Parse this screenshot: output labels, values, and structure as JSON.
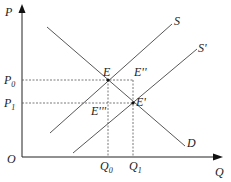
{
  "diagram": {
    "type": "supply-demand",
    "axes": {
      "y_label": "P",
      "x_label": "Q",
      "origin_label": "O"
    },
    "price_ticks": [
      {
        "label": "P",
        "sub": "0"
      },
      {
        "label": "P",
        "sub": "1"
      }
    ],
    "quantity_ticks": [
      {
        "label": "Q",
        "sub": "0"
      },
      {
        "label": "Q",
        "sub": "1"
      }
    ],
    "curves": [
      {
        "label": "S"
      },
      {
        "label": "S'"
      },
      {
        "label": "D"
      }
    ],
    "points": [
      {
        "label": "E"
      },
      {
        "label": "E''"
      },
      {
        "label": "E'"
      },
      {
        "label": "E'''"
      }
    ]
  },
  "caption": ""
}
